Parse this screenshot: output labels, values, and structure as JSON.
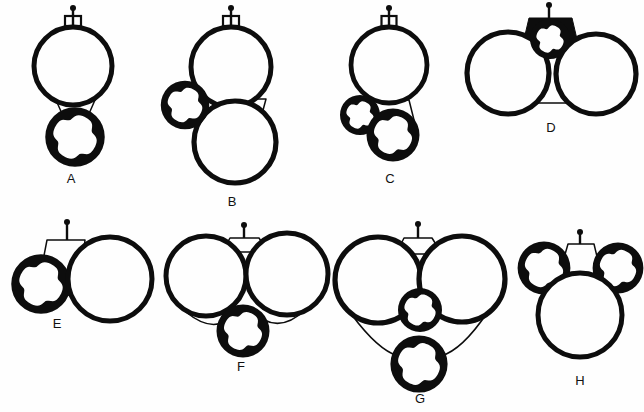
{
  "plate": {
    "title": "Comparative line-drawing plate of eight circular-body configurations",
    "background_color": "#fefefe",
    "ink_color": "#0d0d0d",
    "width": 644,
    "height": 412,
    "rows": 2,
    "columns": 4
  },
  "figures": [
    {
      "id": "A",
      "label": "A",
      "label_x": 71,
      "label_y": 183,
      "row": 1,
      "column": 1,
      "description": "One large plain ring above one small notched ring, joined by a narrow waist; short stem with knob on top",
      "stem": {
        "x": 73,
        "y_top": 8,
        "y_base": 26,
        "knob_r": 3.0,
        "base_w": 16,
        "base_h": 10
      },
      "bodies": [
        {
          "kind": "plain-ring",
          "cx": 73,
          "cy": 66,
          "r": 39,
          "stroke": 5.0
        },
        {
          "kind": "notched-ring",
          "cx": 75,
          "cy": 137,
          "r": 26,
          "stroke": 7.5
        }
      ],
      "necks": [
        {
          "kind": "line-waist",
          "x1": 56,
          "y1": 100,
          "x2": 95,
          "y2": 100,
          "x3": 88,
          "y3": 116,
          "x4": 63,
          "y4": 116
        }
      ],
      "thin_arcs": []
    },
    {
      "id": "B",
      "label": "B",
      "label_x": 232,
      "label_y": 206,
      "row": 1,
      "column": 2,
      "description": "Two large plain rings stacked vertically with a small notched ring attached at the left of their junction; stem on top",
      "stem": {
        "x": 231,
        "y_top": 8,
        "y_base": 26,
        "knob_r": 3.0,
        "base_w": 16,
        "base_h": 10
      },
      "bodies": [
        {
          "kind": "plain-ring",
          "cx": 231,
          "cy": 67,
          "r": 40,
          "stroke": 5.0
        },
        {
          "kind": "plain-ring",
          "cx": 235,
          "cy": 142,
          "r": 41,
          "stroke": 5.2
        },
        {
          "kind": "notched-ring",
          "cx": 185,
          "cy": 105,
          "r": 21,
          "stroke": 6.5
        }
      ],
      "necks": [
        {
          "kind": "line-waist",
          "x1": 206,
          "y1": 99,
          "x2": 266,
          "y2": 99,
          "x3": 262,
          "y3": 114,
          "x4": 210,
          "y4": 114
        }
      ],
      "thin_arcs": []
    },
    {
      "id": "C",
      "label": "C",
      "label_x": 390,
      "label_y": 183,
      "row": 1,
      "column": 3,
      "description": "One large plain ring with two small notched rings clustered at its lower left; stem on top",
      "stem": {
        "x": 389,
        "y_top": 8,
        "y_base": 26,
        "knob_r": 3.0,
        "base_w": 15,
        "base_h": 10
      },
      "bodies": [
        {
          "kind": "plain-ring",
          "cx": 389,
          "cy": 65,
          "r": 38,
          "stroke": 4.8
        },
        {
          "kind": "notched-ring",
          "cx": 360,
          "cy": 115,
          "r": 17,
          "stroke": 6.0
        },
        {
          "kind": "notched-ring",
          "cx": 393,
          "cy": 135,
          "r": 23,
          "stroke": 7.0
        }
      ],
      "necks": [
        {
          "kind": "line-waist",
          "x1": 371,
          "y1": 100,
          "x2": 409,
          "y2": 100,
          "x3": 414,
          "y3": 120,
          "x4": 381,
          "y4": 118
        }
      ],
      "thin_arcs": []
    },
    {
      "id": "D",
      "label": "D",
      "label_x": 551,
      "label_y": 132,
      "row": 1,
      "column": 4,
      "description": "Two large plain rings side by side with a solid dark trapezoidal block between them enclosing a small notched ring; stem on top",
      "stem": {
        "x": 549,
        "y_top": 5,
        "y_base": 18,
        "knob_r": 3.0,
        "base_w": 0,
        "base_h": 0
      },
      "bodies": [
        {
          "kind": "plain-ring",
          "cx": 508,
          "cy": 73,
          "r": 41,
          "stroke": 5.2
        },
        {
          "kind": "plain-ring",
          "cx": 596,
          "cy": 74,
          "r": 40,
          "stroke": 5.2
        },
        {
          "kind": "notched-ring-inverse",
          "cx": 550,
          "cy": 39,
          "r": 17,
          "stroke": 6.0
        }
      ],
      "necks": [
        {
          "kind": "solid-block",
          "x1": 529,
          "y1": 18,
          "x2": 572,
          "y2": 18,
          "x3": 580,
          "y3": 52,
          "x4": 521,
          "y4": 52
        },
        {
          "kind": "line-waist",
          "x1": 538,
          "y1": 52,
          "x2": 562,
          "y2": 52,
          "x3": 575,
          "y3": 103,
          "x4": 527,
          "y4": 103
        }
      ],
      "thin_arcs": []
    },
    {
      "id": "E",
      "label": "E",
      "label_x": 57,
      "label_y": 328,
      "row": 2,
      "column": 1,
      "description": "Small notched ring on the left and a large plain ring on the right linked by an open line-drawn trapezoid body; stem on top",
      "stem": {
        "x": 67,
        "y_top": 222,
        "y_base": 240,
        "knob_r": 3.0,
        "base_w": 0,
        "base_h": 0
      },
      "bodies": [
        {
          "kind": "notched-ring",
          "cx": 41,
          "cy": 284,
          "r": 26,
          "stroke": 7.5
        },
        {
          "kind": "plain-ring",
          "cx": 110,
          "cy": 279,
          "r": 42,
          "stroke": 5.0
        }
      ],
      "necks": [
        {
          "kind": "line-waist",
          "x1": 47,
          "y1": 240,
          "x2": 85,
          "y2": 240,
          "x3": 78,
          "y3": 296,
          "x4": 37,
          "y4": 292
        }
      ],
      "thin_arcs": []
    },
    {
      "id": "F",
      "label": "F",
      "label_x": 241,
      "label_y": 371,
      "row": 2,
      "column": 2,
      "description": "Two large plain rings side by side with a small notched ring below and between them joined by thin curved arcs; stem on top",
      "stem": {
        "x": 244,
        "y_top": 225,
        "y_base": 238,
        "knob_r": 3.0,
        "base_w": 0,
        "base_h": 0
      },
      "bodies": [
        {
          "kind": "plain-ring",
          "cx": 206,
          "cy": 276,
          "r": 40,
          "stroke": 5.0
        },
        {
          "kind": "plain-ring",
          "cx": 287,
          "cy": 274,
          "r": 41,
          "stroke": 5.0
        },
        {
          "kind": "notched-ring",
          "cx": 243,
          "cy": 331,
          "r": 23,
          "stroke": 7.0
        }
      ],
      "necks": [
        {
          "kind": "line-waist",
          "x1": 230,
          "y1": 238,
          "x2": 259,
          "y2": 238,
          "x3": 268,
          "y3": 252,
          "x4": 222,
          "y4": 252
        }
      ],
      "thin_arcs": [
        {
          "x1": 186,
          "y1": 312,
          "cx": 208,
          "cy": 330,
          "x2": 224,
          "y2": 322
        },
        {
          "x1": 305,
          "y1": 310,
          "cx": 284,
          "cy": 330,
          "x2": 264,
          "y2": 320
        }
      ]
    },
    {
      "id": "G",
      "label": "G",
      "label_x": 420,
      "label_y": 403,
      "row": 2,
      "column": 3,
      "description": "Two large plain rings side by side above two small notched rings stacked vertically, joined by thin curved arcs; stem on top",
      "stem": {
        "x": 418,
        "y_top": 224,
        "y_base": 238,
        "knob_r": 3.0,
        "base_w": 0,
        "base_h": 0
      },
      "bodies": [
        {
          "kind": "plain-ring",
          "cx": 378,
          "cy": 280,
          "r": 43,
          "stroke": 5.2
        },
        {
          "kind": "plain-ring",
          "cx": 462,
          "cy": 279,
          "r": 43,
          "stroke": 5.2
        },
        {
          "kind": "notched-ring",
          "cx": 420,
          "cy": 310,
          "r": 19,
          "stroke": 6.0
        },
        {
          "kind": "notched-ring",
          "cx": 419,
          "cy": 364,
          "r": 25,
          "stroke": 7.2
        }
      ],
      "necks": [
        {
          "kind": "line-waist",
          "x1": 404,
          "y1": 238,
          "x2": 432,
          "y2": 238,
          "x3": 442,
          "y3": 254,
          "x4": 396,
          "y4": 254
        }
      ],
      "thin_arcs": [
        {
          "x1": 352,
          "y1": 315,
          "cx": 378,
          "cy": 350,
          "x2": 398,
          "y2": 356
        },
        {
          "x1": 487,
          "y1": 313,
          "cx": 462,
          "cy": 350,
          "x2": 441,
          "y2": 356
        }
      ]
    },
    {
      "id": "H",
      "label": "H",
      "label_x": 580,
      "label_y": 385,
      "row": 2,
      "column": 4,
      "description": "Two small notched rings at upper left and upper right flanking an open trapezoid body above one large plain ring; stem on top",
      "stem": {
        "x": 580,
        "y_top": 232,
        "y_base": 244,
        "knob_r": 3.0,
        "base_w": 0,
        "base_h": 0
      },
      "bodies": [
        {
          "kind": "notched-ring",
          "cx": 544,
          "cy": 268,
          "r": 23,
          "stroke": 6.8
        },
        {
          "kind": "notched-ring",
          "cx": 618,
          "cy": 268,
          "r": 22,
          "stroke": 6.8
        },
        {
          "kind": "plain-ring",
          "cx": 580,
          "cy": 315,
          "r": 42,
          "stroke": 5.0
        }
      ],
      "necks": [
        {
          "kind": "line-waist",
          "x1": 568,
          "y1": 244,
          "x2": 594,
          "y2": 244,
          "x3": 604,
          "y3": 286,
          "x4": 556,
          "y4": 286
        }
      ],
      "thin_arcs": []
    }
  ],
  "labels": [
    "A",
    "B",
    "C",
    "D",
    "E",
    "F",
    "G",
    "H"
  ]
}
